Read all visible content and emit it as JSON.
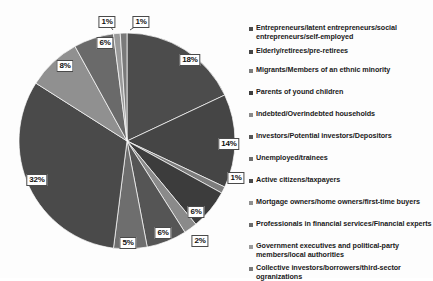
{
  "chart_data": {
    "type": "pie",
    "title": "",
    "xlabel": "",
    "ylabel": "",
    "legend_position": "right",
    "grid": false,
    "value_suffix": "%",
    "categories": [
      "Entrepreneurs/latent entrepreneurs/social entrepreneurs/self-employed",
      "Elderly/retirees/pre-retirees",
      "Migrants/Members of an ethnic minority",
      "Parents of yound children",
      "Indebted/Overindebted households",
      "Investors/Potential investors/Depositors",
      "Unemployed/trainees",
      "Active citizens/taxpayers",
      "Mortgage owners/home owners/first-time buyers",
      "Professionals in financial services/Financial experts",
      "Government executives and political-party members/local authorities",
      "Collective investors/borrowers/third-sector ogranizations"
    ],
    "values": [
      18,
      14,
      1,
      6,
      2,
      6,
      5,
      32,
      8,
      6,
      1,
      1
    ],
    "data_labels": [
      "18%",
      "14%",
      "1%",
      "6%",
      "2%",
      "6%",
      "5%",
      "32%",
      "8%",
      "6%",
      "1%",
      "1%"
    ],
    "slice_colors": [
      "#4c4c4c",
      "#454545",
      "#7d7d7d",
      "#3c3c3c",
      "#8a8a8a",
      "#555555",
      "#6e6e6e",
      "#4a4a4a",
      "#909090",
      "#6a6a6a",
      "#9a9a9a",
      "#7a7a7a"
    ],
    "accent_color": "#4a4a4a"
  },
  "legend": {
    "items": [
      {
        "label": "Entrepreneurs/latent entrepreneurs/social entrepreneurs/self-employed"
      },
      {
        "label": "Elderly/retirees/pre-retirees"
      },
      {
        "label": "Migrants/Members of an ethnic minority"
      },
      {
        "label": "Parents of yound children"
      },
      {
        "label": "Indebted/Overindebted households"
      },
      {
        "label": "Investors/Potential investors/Depositors"
      },
      {
        "label": "Unemployed/trainees"
      },
      {
        "label": "Active citizens/taxpayers"
      },
      {
        "label": "Mortgage owners/home owners/first-time buyers"
      },
      {
        "label": "Professionals in financial services/Financial experts"
      },
      {
        "label": "Government executives and political-party members/local authorities"
      },
      {
        "label": "Collective investors/borrowers/third-sector ogranizations"
      }
    ]
  },
  "labels": [
    {
      "text": "18%",
      "x": 190,
      "y": 60
    },
    {
      "text": "14%",
      "x": 229,
      "y": 144
    },
    {
      "text": "1%",
      "x": 236,
      "y": 178
    },
    {
      "text": "6%",
      "x": 196,
      "y": 212
    },
    {
      "text": "2%",
      "x": 200,
      "y": 241
    },
    {
      "text": "6%",
      "x": 163,
      "y": 233
    },
    {
      "text": "5%",
      "x": 128,
      "y": 243
    },
    {
      "text": "32%",
      "x": 37,
      "y": 180
    },
    {
      "text": "8%",
      "x": 65,
      "y": 66
    },
    {
      "text": "6%",
      "x": 105,
      "y": 43
    },
    {
      "text": "1%",
      "x": 107,
      "y": 22
    },
    {
      "text": "1%",
      "x": 141,
      "y": 22
    }
  ]
}
